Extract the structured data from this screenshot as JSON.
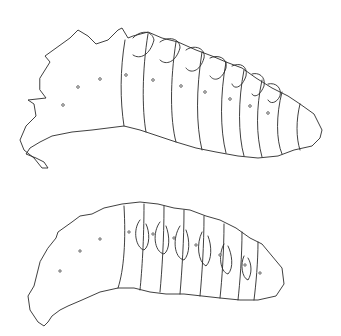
{
  "figure": {
    "background": "#ffffff",
    "stroke_color": "#2a2a2a",
    "specimens": [
      {
        "id": "upper-larva",
        "view": "lateral",
        "segments": 12,
        "spiracles": 9
      },
      {
        "id": "lower-larva",
        "view": "lateral",
        "segments": 12,
        "spiracles": 8
      }
    ]
  }
}
